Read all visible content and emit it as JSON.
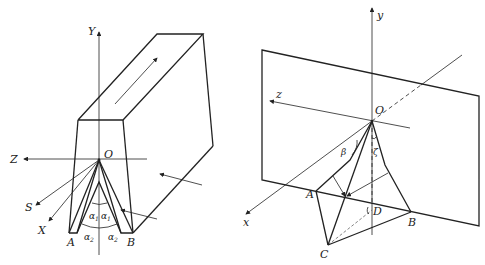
{
  "figure_left": {
    "description": "V-groove guide block with coordinate axes",
    "axes": {
      "Y": "Y",
      "Z": "Z",
      "S": "S",
      "X": "X",
      "origin": "O"
    },
    "points": {
      "A": "A",
      "B": "B"
    },
    "angles": {
      "alpha1_left": "α",
      "alpha1_right": "α",
      "alpha2_left": "α",
      "alpha2_right": "α",
      "sub1": "1",
      "sub2": "2"
    }
  },
  "figure_right": {
    "description": "Plane with tetrahedral geometry and coordinate axes",
    "axes": {
      "y": "y",
      "z": "z",
      "x": "x",
      "origin": "O"
    },
    "points": {
      "A": "A",
      "B": "B",
      "C": "C",
      "D": "D"
    },
    "angles": {
      "beta": "β",
      "zeta": "ζ"
    }
  },
  "colors": {
    "stroke": "#222222",
    "dashed": "#555555",
    "background": "#ffffff"
  }
}
